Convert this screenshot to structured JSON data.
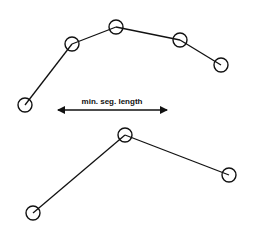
{
  "diagram": {
    "stroke_color": "#111111",
    "node_radius": 7,
    "top_chain": {
      "nodes": [
        {
          "x": 25,
          "y": 105
        },
        {
          "x": 72,
          "y": 44
        },
        {
          "x": 116,
          "y": 27
        },
        {
          "x": 180,
          "y": 40
        },
        {
          "x": 221,
          "y": 65
        }
      ]
    },
    "arrow": {
      "label": "min. seg. length",
      "x1": 58,
      "x2": 167,
      "y": 110,
      "label_x": 112,
      "label_y": 104
    },
    "bottom_chain": {
      "nodes": [
        {
          "x": 33,
          "y": 213
        },
        {
          "x": 125,
          "y": 135
        },
        {
          "x": 229,
          "y": 175
        }
      ]
    }
  }
}
